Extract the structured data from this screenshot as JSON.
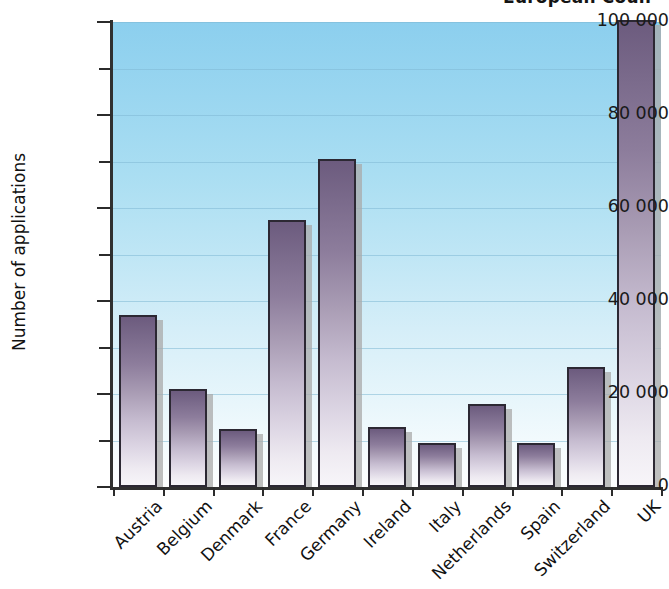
{
  "chart_data": {
    "type": "bar",
    "title": "European Coun",
    "title_note": "cropped at top edge of screenshot",
    "xlabel": "",
    "ylabel": "Number of applications",
    "categories": [
      "Austria",
      "Belgium",
      "Denmark",
      "France",
      "Germany",
      "Ireland",
      "Italy",
      "Netherlands",
      "Spain",
      "Switzerland",
      "UK"
    ],
    "values": [
      37000,
      21000,
      12500,
      57500,
      70500,
      12800,
      9500,
      17800,
      9500,
      25800,
      100500
    ],
    "ylim": [
      0,
      100000
    ],
    "ytick_labels": [
      "0",
      "20000",
      "40000",
      "60000",
      "80000",
      "100000"
    ],
    "ytick_labels_display": [
      "0",
      "20 000",
      "40 000",
      "60 000",
      "80 000",
      "100 000"
    ],
    "ytick_values": [
      0,
      20000,
      40000,
      60000,
      80000,
      100000
    ],
    "minor_tick_values": [
      10000,
      30000,
      50000,
      70000,
      90000
    ],
    "grid": true,
    "legend": "none",
    "series_color": "#7a6a8b",
    "plot_background_top": "#8ccfee",
    "plot_background_bottom": "#fdfeff",
    "gridline_color": "#7fb8d4",
    "axis_color": "#303030"
  }
}
